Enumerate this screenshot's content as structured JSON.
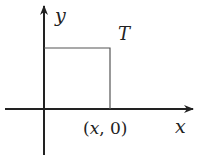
{
  "axes": {
    "x_label": "x",
    "y_label": "y"
  },
  "region": {
    "label": "T",
    "corner_label_open": "(",
    "corner_label_var": "x",
    "corner_label_rest": ", 0)"
  },
  "colors": {
    "axis": "#222222",
    "square": "#555555"
  }
}
